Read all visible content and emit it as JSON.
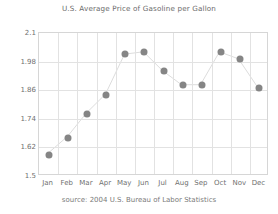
{
  "chart_data": {
    "type": "line",
    "title": "U.S. Average Price of Gasoline per Gallon",
    "subtitle": "",
    "xlabel": "",
    "ylabel": "",
    "categories": [
      "Jan",
      "Feb",
      "Mar",
      "Apr",
      "May",
      "Jun",
      "Jul",
      "Aug",
      "Sep",
      "Oct",
      "Nov",
      "Dec"
    ],
    "values": [
      1.59,
      1.66,
      1.76,
      1.84,
      2.01,
      2.02,
      1.94,
      1.88,
      1.88,
      2.02,
      1.99,
      1.87
    ],
    "series": [
      {
        "name": "U.S. Average Price of Gasoline per Gallon",
        "values": [
          1.59,
          1.66,
          1.76,
          1.84,
          2.01,
          2.02,
          1.94,
          1.88,
          1.88,
          2.02,
          1.99,
          1.87
        ]
      }
    ],
    "ylim": [
      1.5,
      2.1
    ],
    "yticks": [
      1.5,
      1.62,
      1.74,
      1.86,
      1.98,
      2.1
    ],
    "ytick_labels": [
      "1.5",
      "1.62",
      "1.74",
      "1.86",
      "1.98",
      "2.1"
    ],
    "xtick_labels": [
      "Jan",
      "Feb",
      "Mar",
      "Apr",
      "May",
      "Jun",
      "Jul",
      "Aug",
      "Sep",
      "Oct",
      "Nov",
      "Dec"
    ],
    "grid": true,
    "grid_horizontal": true,
    "grid_vertical": true,
    "legend": false,
    "legend_position": "none",
    "marker": "circle",
    "marker_color": "#858585",
    "line_color": "#dcdcdc",
    "grid_color": "#e2e2e2",
    "axis_color": "#d6d6d6",
    "text_color": "#6f6f6f",
    "background": "#ffffff"
  },
  "source": {
    "text": "source: 2004 U.S. Bureau of Labor Statistics"
  }
}
